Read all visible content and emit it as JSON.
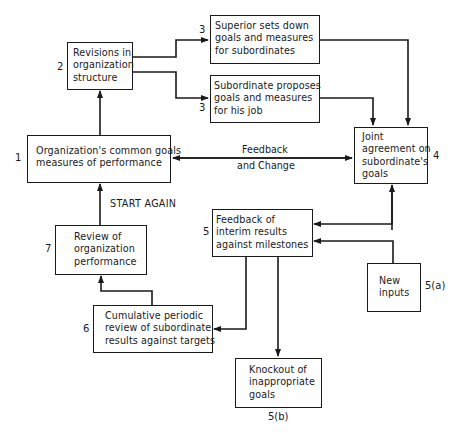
{
  "diagram": {
    "type": "flowchart",
    "nodes": [
      {
        "id": "1",
        "label_number": "1",
        "lines": [
          "Organization's common goals",
          "measures of performance"
        ]
      },
      {
        "id": "2",
        "label_number": "2",
        "lines": [
          "Revisions in",
          "organization",
          "structure"
        ]
      },
      {
        "id": "3a",
        "label_number": "3",
        "lines": [
          "Superior sets down",
          "goals and measures",
          "for subordinates"
        ]
      },
      {
        "id": "3b",
        "label_number": "3",
        "lines": [
          "Subordinate proposes",
          "goals and measures",
          "for his job"
        ]
      },
      {
        "id": "4",
        "label_number": "4",
        "lines": [
          "Joint",
          "agreement on",
          "subordinate's",
          "goals"
        ]
      },
      {
        "id": "5",
        "label_number": "5",
        "lines": [
          "Feedback of",
          "interim results",
          "against milestones"
        ]
      },
      {
        "id": "5a",
        "label_number": "5(a)",
        "lines": [
          "New",
          "inputs"
        ]
      },
      {
        "id": "5b",
        "label_number": "5(b)",
        "lines": [
          "Knockout of",
          "inappropriate",
          "goals"
        ]
      },
      {
        "id": "6",
        "label_number": "6",
        "lines": [
          "Cumulative periodic",
          "review of subordinate",
          "results against targets"
        ]
      },
      {
        "id": "7",
        "label_number": "7",
        "lines": [
          "Review of",
          "organization",
          "performance"
        ]
      }
    ],
    "edges": [
      {
        "from": "1",
        "to": "2"
      },
      {
        "from": "2",
        "to": "3a"
      },
      {
        "from": "2",
        "to": "3b"
      },
      {
        "from": "3a",
        "to": "4"
      },
      {
        "from": "3b",
        "to": "4"
      },
      {
        "from": "1",
        "to": "4",
        "bidirectional": true,
        "label": [
          "Feedback",
          "and Change"
        ]
      },
      {
        "from": "4",
        "to": "5",
        "bidirectional": true
      },
      {
        "from": "5a",
        "to": "5"
      },
      {
        "from": "5",
        "to": "6"
      },
      {
        "from": "5",
        "to": "5b"
      },
      {
        "from": "6",
        "to": "7"
      },
      {
        "from": "7",
        "to": "1",
        "label": [
          "START AGAIN"
        ]
      }
    ],
    "edge_labels": {
      "feedback_line1": "Feedback",
      "feedback_line2": "and Change",
      "start_again": "START AGAIN"
    },
    "colors": {
      "ink": "#1a1a1a",
      "background": "#ffffff"
    }
  }
}
